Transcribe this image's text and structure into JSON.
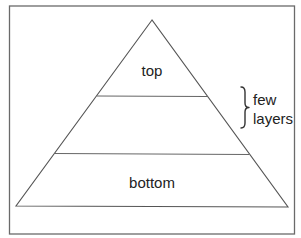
{
  "diagram": {
    "type": "pyramid",
    "layers": [
      {
        "id": "top",
        "label": "top"
      },
      {
        "id": "middle",
        "label": ""
      },
      {
        "id": "bottom",
        "label": "bottom"
      }
    ],
    "annotation": {
      "line1": "few",
      "line2": "layers",
      "brace_target_layer": "middle"
    },
    "colors": {
      "frame": "#6a6a6a",
      "lines": "#555555",
      "text": "#222222",
      "background": "#ffffff"
    }
  }
}
